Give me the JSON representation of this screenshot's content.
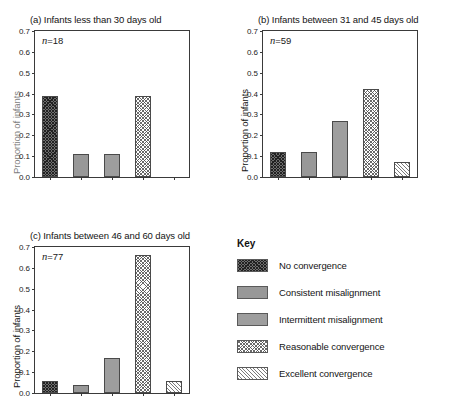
{
  "chart_data": {
    "type": "bar",
    "title": "",
    "xlabel": "",
    "ylabel": "Proportion of infants",
    "ylim": [
      0.0,
      0.7
    ],
    "ytick_labels": [
      "0.0",
      "0.1",
      "0.2",
      "0.3",
      "0.4",
      "0.5",
      "0.6",
      "0.7"
    ],
    "ytick_values": [
      0.0,
      0.1,
      0.2,
      0.3,
      0.4,
      0.5,
      0.6,
      0.7
    ],
    "grid": false,
    "legend_position": "bottom-right",
    "categories": [
      "No convergence",
      "Consistent misalignment",
      "Intermittent misalignment",
      "Reasonable convergence",
      "Excellent convergence"
    ],
    "panels": [
      {
        "id": "a",
        "title": "(a) Infants less than 30 days old",
        "n_label": "n =18",
        "n_prefix": "n",
        "n_value": "=18",
        "ylabel": "Proportion of infants",
        "values": [
          0.39,
          0.11,
          0.11,
          0.39,
          0.0
        ]
      },
      {
        "id": "b",
        "title": "(b) Infants between 31 and 45 days old",
        "n_label": "n =59",
        "n_prefix": "n",
        "n_value": "=59",
        "ylabel": "Proportion of infants",
        "values": [
          0.12,
          0.12,
          0.27,
          0.42,
          0.07
        ]
      },
      {
        "id": "c",
        "title": "(c) Infants between 46 and 60 days old",
        "n_label": "n =77",
        "n_prefix": "n",
        "n_value": "=77",
        "ylabel": "Proportion of infants",
        "values": [
          0.06,
          0.04,
          0.17,
          0.66,
          0.06
        ]
      }
    ],
    "legend": {
      "title": "Key",
      "entries": [
        {
          "label": "No convergence",
          "pattern": "dark-crosshatch",
          "color": "#6e6e6e"
        },
        {
          "label": "Consistent misalignment",
          "pattern": "solid-grey",
          "color": "#989898"
        },
        {
          "label": "Intermittent misalignment",
          "pattern": "solid-grey-light",
          "color": "#9e9e9e"
        },
        {
          "label": "Reasonable convergence",
          "pattern": "light-crosshatch",
          "color": "#ffffff"
        },
        {
          "label": "Excellent convergence",
          "pattern": "light-diagonal",
          "color": "#ffffff"
        }
      ]
    }
  }
}
